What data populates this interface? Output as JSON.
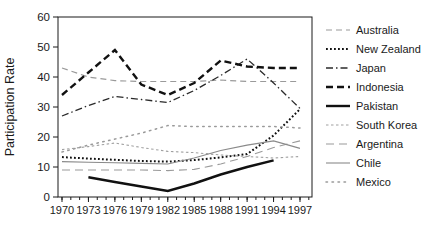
{
  "figure": {
    "background": "#ffffff",
    "axis_color": "#1a1a1a",
    "text_color": "#1a1a1a"
  },
  "chart_data": {
    "type": "line",
    "title": "",
    "xlabel": "",
    "ylabel": "Participation Rate",
    "ylim": [
      0,
      60
    ],
    "yticks": [
      0,
      10,
      20,
      30,
      40,
      50,
      60
    ],
    "x_tick_years": [
      1970,
      1973,
      1976,
      1979,
      1982,
      1985,
      1988,
      1991,
      1994,
      1997
    ],
    "minor_x_ticks_every_year": true,
    "grid": false,
    "legend_position": "right",
    "categories": [
      1970,
      1973,
      1976,
      1979,
      1982,
      1985,
      1988,
      1991,
      1994,
      1997
    ],
    "series": [
      {
        "name": "Australia",
        "color": "#9a9a9a",
        "dash": "6,4",
        "width": 1.2,
        "linecap": "butt",
        "values": [
          43,
          40,
          38.8,
          38.5,
          38.5,
          38.5,
          39,
          38.5,
          38.5,
          38.5
        ]
      },
      {
        "name": "New Zealand",
        "color": "#111111",
        "dash": "1.8,2.2",
        "width": 2.0,
        "linecap": "butt",
        "values": [
          13.3,
          12.8,
          12.4,
          12,
          11.8,
          12.3,
          13.2,
          14.3,
          20.5,
          29.3
        ]
      },
      {
        "name": "Japan",
        "color": "#2a2a2a",
        "dash": "7,3,1.5,3",
        "width": 1.3,
        "linecap": "butt",
        "values": [
          27,
          30.5,
          33.5,
          32.5,
          31.5,
          35.5,
          40.5,
          46,
          38,
          29.5
        ]
      },
      {
        "name": "Indonesia",
        "color": "#111111",
        "dash": "7,4",
        "width": 2.4,
        "linecap": "butt",
        "values": [
          34,
          41.5,
          49,
          37.5,
          34,
          38,
          45.5,
          43.5,
          43,
          43
        ]
      },
      {
        "name": "Pakistan",
        "color": "#111111",
        "dash": "",
        "width": 2.4,
        "linecap": "butt",
        "values": [
          null,
          6.6,
          5,
          3.5,
          2,
          4.5,
          7.5,
          10,
          12.2,
          null
        ]
      },
      {
        "name": "South Korea",
        "color": "#a0a0a0",
        "dash": "2.5,2.5",
        "width": 1.1,
        "linecap": "butt",
        "values": [
          15.8,
          16.8,
          18,
          16.5,
          15.2,
          14.8,
          14,
          13.5,
          13,
          13.5
        ]
      },
      {
        "name": "Argentina",
        "color": "#9a9a9a",
        "dash": "8,5",
        "width": 1.1,
        "linecap": "butt",
        "values": [
          9,
          9,
          9,
          9,
          8.8,
          9.2,
          11,
          13.5,
          16.5,
          18.7
        ]
      },
      {
        "name": "Chile",
        "color": "#8a8a8a",
        "dash": "",
        "width": 1.1,
        "linecap": "butt",
        "values": [
          11.8,
          11.6,
          11.4,
          11.2,
          11,
          13,
          15.5,
          17.3,
          18.7,
          16.2
        ]
      },
      {
        "name": "Mexico",
        "color": "#9a9a9a",
        "dash": "1.5,4.5",
        "width": 1.5,
        "linecap": "round",
        "values": [
          15,
          17.3,
          19.3,
          21.3,
          23.8,
          23.5,
          23.5,
          23.5,
          23.5,
          23
        ]
      }
    ]
  }
}
